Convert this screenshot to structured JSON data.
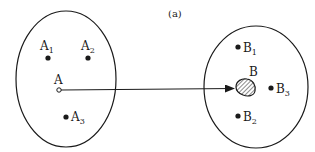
{
  "caption": "(a)",
  "set_A": {
    "points": [
      {
        "label": "A",
        "sub": "1"
      },
      {
        "label": "A",
        "sub": "2"
      },
      {
        "label": "A",
        "sub": ""
      },
      {
        "label": "A",
        "sub": "3"
      }
    ]
  },
  "set_B": {
    "points": [
      {
        "label": "B",
        "sub": "1"
      },
      {
        "label": "B",
        "sub": "2"
      },
      {
        "label": "B",
        "sub": "3"
      },
      {
        "label": "B",
        "sub": ""
      }
    ]
  },
  "colors": {
    "stroke": "#1a1a1a",
    "background": "#ffffff"
  }
}
